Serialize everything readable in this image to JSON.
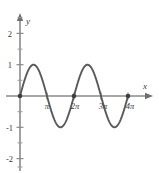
{
  "figure": {
    "title": "",
    "curve_color": "#5a5a5a",
    "axis_color": "#8a8a8a",
    "text_color": "#3a3a3a",
    "background": "#ffffff",
    "x_axis_label": "x",
    "y_axis_label": "y"
  },
  "chart_data": {
    "type": "line",
    "title": "",
    "xlabel": "x",
    "ylabel": "y",
    "grid": false,
    "legend": null,
    "function": "y = sin(x)",
    "xlim": [
      -0.6,
      14.2
    ],
    "ylim": [
      -2.6,
      2.6
    ],
    "x_tick_labels": [
      "π",
      "2π",
      "3π",
      "4π"
    ],
    "x_tick_values": [
      3.14159,
      6.28319,
      9.42478,
      12.56637
    ],
    "y_tick_labels": [
      "2",
      "1",
      "-1",
      "-2"
    ],
    "y_tick_values": [
      2,
      1,
      -1,
      -2
    ],
    "y_minor_ticks": [
      2.5,
      1.5,
      0.5,
      -0.5,
      -1.5,
      -2.5
    ],
    "marked_points": [
      {
        "x": 0,
        "y": 0
      },
      {
        "x": 6.28319,
        "y": 0
      },
      {
        "x": 12.56637,
        "y": 0
      }
    ],
    "x": [
      0,
      0.3927,
      0.7854,
      1.1781,
      1.5708,
      1.9635,
      2.3562,
      2.7489,
      3.14159,
      3.5343,
      3.927,
      4.3197,
      4.7124,
      5.1051,
      5.4978,
      5.8905,
      6.28319,
      6.6759,
      7.0686,
      7.4613,
      7.854,
      8.2467,
      8.6394,
      9.0321,
      9.42478,
      9.8175,
      10.2102,
      10.6029,
      10.9956,
      11.3883,
      11.781,
      12.1737,
      12.56637
    ],
    "y": [
      0,
      0.3827,
      0.7071,
      0.9239,
      1,
      0.9239,
      0.7071,
      0.3827,
      0,
      -0.3827,
      -0.7071,
      -0.9239,
      -1,
      -0.9239,
      -0.7071,
      -0.3827,
      0,
      0.3827,
      0.7071,
      0.9239,
      1,
      0.9239,
      0.7071,
      0.3827,
      0,
      -0.3827,
      -0.7071,
      -0.9239,
      -1,
      -0.9239,
      -0.7071,
      -0.3827,
      0
    ],
    "maxima": [
      {
        "x": 1.5708,
        "y": 1
      },
      {
        "x": 7.854,
        "y": 1
      }
    ],
    "minima": [
      {
        "x": 4.7124,
        "y": -1
      },
      {
        "x": 10.9956,
        "y": -1
      }
    ],
    "zeros": [
      0,
      3.14159,
      6.28319,
      9.42478,
      12.56637
    ]
  }
}
